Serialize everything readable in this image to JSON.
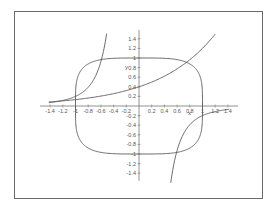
{
  "chart_data": {
    "type": "line",
    "title": "",
    "xlabel": "x",
    "ylabel": "y",
    "xlim": [
      -1.5,
      1.5
    ],
    "ylim": [
      -1.5,
      1.5
    ],
    "grid": false,
    "legend": null,
    "x_ticks": [
      -1.4,
      -1.2,
      -1,
      -0.8,
      -0.6,
      -0.4,
      -0.2,
      0.2,
      0.4,
      0.6,
      0.8,
      1,
      1.2,
      1.4
    ],
    "x_tick_labels": [
      "-1.4",
      "-1.2",
      "-1",
      "-0.8",
      "-0.6",
      "-0.4",
      "-0.2",
      "0.2",
      "0.4",
      "0.6",
      "0.8",
      "1",
      "1.2",
      "1.4"
    ],
    "y_ticks": [
      1.4,
      1.2,
      1,
      0.8,
      0.6,
      0.4,
      0.2,
      -0.2,
      -0.4,
      -0.6,
      -0.8,
      -1,
      -1.2,
      -1.4
    ],
    "y_tick_labels": [
      "1.4",
      "1.2",
      "1",
      "0.8",
      "0.6",
      "0.4",
      "0.2",
      "-0.2",
      "-0.4",
      "-0.6",
      "-0.8",
      "-1",
      "-1.2",
      "-1.4"
    ],
    "series": [
      {
        "name": "superellipse x^4 + y^4 = 1",
        "kind": "implicit",
        "points": [
          [
            1,
            0
          ],
          [
            0.99,
            0.5
          ],
          [
            0.93,
            0.75
          ],
          [
            0.84,
            0.87
          ],
          [
            0.75,
            0.93
          ],
          [
            0.5,
            0.99
          ],
          [
            0,
            1
          ],
          [
            -0.5,
            0.99
          ],
          [
            -0.75,
            0.93
          ],
          [
            -0.84,
            0.87
          ],
          [
            -0.93,
            0.75
          ],
          [
            -0.99,
            0.5
          ],
          [
            -1,
            0
          ],
          [
            -0.99,
            -0.5
          ],
          [
            -0.93,
            -0.75
          ],
          [
            -0.84,
            -0.87
          ],
          [
            -0.75,
            -0.93
          ],
          [
            -0.5,
            -0.99
          ],
          [
            0,
            -1
          ],
          [
            0.5,
            -0.99
          ],
          [
            0.75,
            -0.93
          ],
          [
            0.84,
            -0.87
          ],
          [
            0.93,
            -0.75
          ],
          [
            0.99,
            -0.5
          ],
          [
            1,
            0
          ]
        ]
      },
      {
        "name": "exponential curve",
        "kind": "function",
        "x": [
          -1.4,
          -1.2,
          -1.0,
          -0.8,
          -0.6,
          -0.4,
          -0.2,
          0.0,
          0.2,
          0.4,
          0.6,
          0.8,
          1.0,
          1.2
        ],
        "y": [
          0.09,
          0.11,
          0.13,
          0.17,
          0.21,
          0.26,
          0.32,
          0.4,
          0.5,
          0.62,
          0.77,
          0.96,
          1.2,
          1.5
        ]
      },
      {
        "name": "odd hyperbolic curve (upper-left branch)",
        "kind": "function",
        "x": [
          -1.4,
          -1.2,
          -1.0,
          -0.9,
          -0.8,
          -0.7,
          -0.6,
          -0.55,
          -0.5
        ],
        "y": [
          0.07,
          0.12,
          0.2,
          0.27,
          0.39,
          0.58,
          0.93,
          1.2,
          1.5
        ]
      },
      {
        "name": "odd hyperbolic curve (lower-right branch)",
        "kind": "function",
        "x": [
          0.5,
          0.55,
          0.6,
          0.7,
          0.8,
          0.9,
          1.0,
          1.2,
          1.4
        ],
        "y": [
          -1.5,
          -1.2,
          -0.93,
          -0.58,
          -0.39,
          -0.27,
          -0.2,
          -0.12,
          -0.07
        ]
      }
    ]
  },
  "labels": {
    "x_axis": "x",
    "y_axis": "y"
  }
}
